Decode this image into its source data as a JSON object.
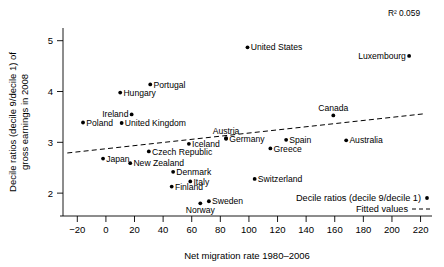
{
  "chart_data": {
    "type": "scatter",
    "title": "",
    "xlabel": "Net migration rate 1980–2006",
    "ylabel": "Decile ratios (decile 9/decile 1) of gross earnings in 2008",
    "ylabel_line1": "Decile ratios (decile 9/decile 1) of",
    "ylabel_line2": "gross earnings in 2008",
    "xlim": [
      -30,
      228
    ],
    "ylim": [
      1.55,
      5.25
    ],
    "xticks": [
      -20,
      0,
      20,
      40,
      60,
      80,
      100,
      120,
      140,
      160,
      180,
      200,
      220
    ],
    "xtick_labels": [
      "−20",
      "0",
      "20",
      "40",
      "60",
      "80",
      "100",
      "120",
      "140",
      "160",
      "180",
      "200",
      "220"
    ],
    "yticks": [
      2,
      3,
      4,
      5
    ],
    "ytick_labels": [
      "2",
      "3",
      "4",
      "5"
    ],
    "grid": false,
    "annotation_r2": "R² 0.059",
    "legend_position": "bottom-right",
    "legend": [
      {
        "label": "Decile ratios (decile 9/decile 1)",
        "marker": "dot"
      },
      {
        "label": "Fitted values",
        "marker": "dashed-line"
      }
    ],
    "series": [
      {
        "name": "Decile ratios (decile 9/decile 1)",
        "marker_color": "#000000",
        "points": [
          {
            "label": "Poland",
            "x": -16,
            "y": 3.39,
            "label_side": "right"
          },
          {
            "label": "Japan",
            "x": -2,
            "y": 2.68,
            "label_side": "right"
          },
          {
            "label": "Hungary",
            "x": 10,
            "y": 3.98,
            "label_side": "right"
          },
          {
            "label": "United Kingdom",
            "x": 11,
            "y": 3.38,
            "label_side": "right"
          },
          {
            "label": "Ireland",
            "x": 18,
            "y": 3.55,
            "label_side": "left"
          },
          {
            "label": "New Zealand",
            "x": 17,
            "y": 2.59,
            "label_side": "right"
          },
          {
            "label": "Portugal",
            "x": 31,
            "y": 4.14,
            "label_side": "right"
          },
          {
            "label": "Czech Republic",
            "x": 30,
            "y": 2.82,
            "label_side": "right"
          },
          {
            "label": "Denmark",
            "x": 47,
            "y": 2.42,
            "label_side": "right"
          },
          {
            "label": "Finland",
            "x": 46,
            "y": 2.13,
            "label_side": "right"
          },
          {
            "label": "Iceland",
            "x": 58,
            "y": 2.97,
            "label_side": "right"
          },
          {
            "label": "Italy",
            "x": 59,
            "y": 2.23,
            "label_side": "right"
          },
          {
            "label": "Norway",
            "x": 66,
            "y": 1.8,
            "label_side": "below"
          },
          {
            "label": "Sweden",
            "x": 72,
            "y": 1.84,
            "label_side": "right"
          },
          {
            "label": "Austria",
            "x": 84,
            "y": 3.08,
            "label_side": "above"
          },
          {
            "label": "Germany",
            "x": 84,
            "y": 3.07,
            "label_side": "right"
          },
          {
            "label": "United States",
            "x": 99,
            "y": 4.87,
            "label_side": "right"
          },
          {
            "label": "Switzerland",
            "x": 104,
            "y": 2.28,
            "label_side": "right"
          },
          {
            "label": "Greece",
            "x": 115,
            "y": 2.88,
            "label_side": "right"
          },
          {
            "label": "Spain",
            "x": 126,
            "y": 3.05,
            "label_side": "right"
          },
          {
            "label": "Canada",
            "x": 159,
            "y": 3.53,
            "label_side": "above"
          },
          {
            "label": "Australia",
            "x": 168,
            "y": 3.04,
            "label_side": "right"
          },
          {
            "label": "Luxembourg",
            "x": 212,
            "y": 4.7,
            "label_side": "left"
          }
        ]
      }
    ],
    "fitted_line": {
      "name": "Fitted values",
      "style": "dashed",
      "x_start": -27,
      "y_start": 2.79,
      "x_end": 222,
      "y_end": 3.56
    }
  }
}
